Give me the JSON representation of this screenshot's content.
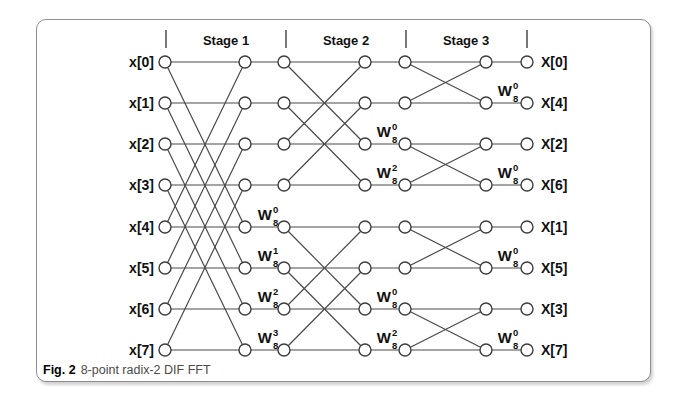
{
  "figure": {
    "caption_bold": "Fig. 2",
    "caption_text": "8-point radix-2 DIF FFT"
  },
  "diagram": {
    "stage_labels": [
      "Stage 1",
      "Stage 2",
      "Stage 3"
    ],
    "input_labels": [
      "x[0]",
      "x[1]",
      "x[2]",
      "x[3]",
      "x[4]",
      "x[5]",
      "x[6]",
      "x[7]"
    ],
    "output_labels": [
      "X[0]",
      "X[4]",
      "X[2]",
      "X[6]",
      "X[1]",
      "X[5]",
      "X[3]",
      "X[7]"
    ],
    "butterfly_pairs_by_stage": [
      [
        [
          0,
          4
        ],
        [
          1,
          5
        ],
        [
          2,
          6
        ],
        [
          3,
          7
        ]
      ],
      [
        [
          0,
          2
        ],
        [
          1,
          3
        ],
        [
          4,
          6
        ],
        [
          5,
          7
        ]
      ],
      [
        [
          0,
          1
        ],
        [
          2,
          3
        ],
        [
          4,
          5
        ],
        [
          6,
          7
        ]
      ]
    ],
    "twiddle_base": "W",
    "twiddle_subscript": "8",
    "twiddles": [
      {
        "stage": 1,
        "row": 4,
        "exp": "0"
      },
      {
        "stage": 1,
        "row": 5,
        "exp": "1"
      },
      {
        "stage": 1,
        "row": 6,
        "exp": "2"
      },
      {
        "stage": 1,
        "row": 7,
        "exp": "3"
      },
      {
        "stage": 2,
        "row": 2,
        "exp": "0"
      },
      {
        "stage": 2,
        "row": 3,
        "exp": "2"
      },
      {
        "stage": 2,
        "row": 6,
        "exp": "0"
      },
      {
        "stage": 2,
        "row": 7,
        "exp": "2"
      },
      {
        "stage": 3,
        "row": 1,
        "exp": "0"
      },
      {
        "stage": 3,
        "row": 3,
        "exp": "0"
      },
      {
        "stage": 3,
        "row": 5,
        "exp": "0"
      },
      {
        "stage": 3,
        "row": 7,
        "exp": "0"
      }
    ],
    "colors": {
      "line": "#4a4a4a",
      "node_stroke": "#3d3d3d",
      "node_fill": "#ffffff",
      "text": "#111111",
      "border": "#8e8e8e",
      "caption_text": "#4a4a4a"
    }
  }
}
